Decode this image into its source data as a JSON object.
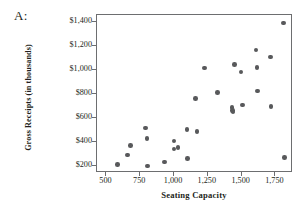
{
  "panel": {
    "label": "A:"
  },
  "chart_data": {
    "type": "scatter",
    "title": "",
    "xlabel": "Seating Capacity",
    "ylabel": "Gross Receipts (in thousands)",
    "xlim": [
      430,
      1880
    ],
    "ylim": [
      140,
      1460
    ],
    "xticks": [
      500,
      750,
      1000,
      1250,
      1500,
      1750
    ],
    "xtick_labels": [
      "500",
      "750",
      "1,000",
      "1,250",
      "1,500",
      "1,750"
    ],
    "yticks": [
      200,
      400,
      600,
      800,
      1000,
      1200,
      1400
    ],
    "ytick_labels": [
      "$200",
      "$400",
      "$600",
      "$800",
      "$1,000",
      "$1,200",
      "$1,400"
    ],
    "grid": false,
    "legend": null,
    "marker_color": "#58595b",
    "frame_color": "#6d6e70",
    "points": [
      {
        "x": 580,
        "y": 210
      },
      {
        "x": 655,
        "y": 290
      },
      {
        "x": 680,
        "y": 372
      },
      {
        "x": 790,
        "y": 515
      },
      {
        "x": 800,
        "y": 430
      },
      {
        "x": 805,
        "y": 200
      },
      {
        "x": 930,
        "y": 232
      },
      {
        "x": 1000,
        "y": 408
      },
      {
        "x": 1000,
        "y": 342
      },
      {
        "x": 1030,
        "y": 355
      },
      {
        "x": 1095,
        "y": 503
      },
      {
        "x": 1100,
        "y": 262
      },
      {
        "x": 1160,
        "y": 762
      },
      {
        "x": 1170,
        "y": 488
      },
      {
        "x": 1225,
        "y": 1018
      },
      {
        "x": 1320,
        "y": 812
      },
      {
        "x": 1430,
        "y": 688
      },
      {
        "x": 1432,
        "y": 662
      },
      {
        "x": 1435,
        "y": 648
      },
      {
        "x": 1448,
        "y": 1048
      },
      {
        "x": 1495,
        "y": 985
      },
      {
        "x": 1505,
        "y": 708
      },
      {
        "x": 1605,
        "y": 1168
      },
      {
        "x": 1615,
        "y": 1022
      },
      {
        "x": 1618,
        "y": 825
      },
      {
        "x": 1712,
        "y": 1110
      },
      {
        "x": 1718,
        "y": 695
      },
      {
        "x": 1810,
        "y": 1392
      },
      {
        "x": 1818,
        "y": 268
      }
    ]
  }
}
